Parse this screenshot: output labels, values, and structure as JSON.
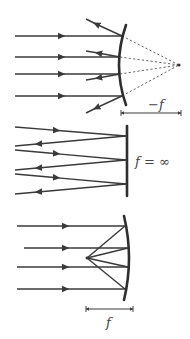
{
  "diagrams": [
    {
      "name": "convex-mirror",
      "label": "−f",
      "description": "Parallel rays reflect off convex mirror and diverge from virtual focal point behind mirror"
    },
    {
      "name": "plane-mirror",
      "label": "f = ∞",
      "description": "Rays reflect off a flat mirror"
    },
    {
      "name": "concave-mirror",
      "label": "f",
      "description": "Parallel rays reflect off concave mirror and converge at focal point"
    }
  ],
  "colors": {
    "line": "#3a3a3a",
    "background": "#ffffff"
  }
}
